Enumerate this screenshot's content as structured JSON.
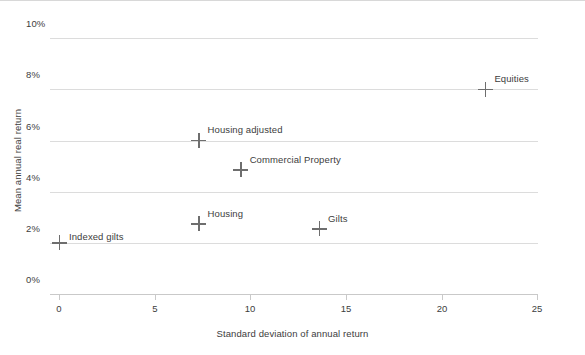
{
  "chart_data": {
    "type": "scatter",
    "title": "",
    "xlabel": "Standard deviation of annual return",
    "ylabel": "Mean annual real return",
    "xlim": [
      0,
      25
    ],
    "ylim": [
      0,
      10
    ],
    "xticks": [
      "0",
      "5",
      "10",
      "15",
      "20",
      "25"
    ],
    "xtick_values": [
      0,
      5,
      10,
      15,
      20,
      25
    ],
    "yticks": [
      "0%",
      "2%",
      "4%",
      "6%",
      "8%",
      "10%"
    ],
    "ytick_values": [
      0,
      2,
      4,
      6,
      8,
      10
    ],
    "grid": "horizontal",
    "legend": "none",
    "marker_style": "plus",
    "marker_color": "#6e6e6e",
    "points": [
      {
        "label": "Indexed gilts",
        "x": 0.0,
        "y": 2.0,
        "label_pos": "right"
      },
      {
        "label": "Housing",
        "x": 7.3,
        "y": 2.75,
        "label_pos": "upper-right"
      },
      {
        "label": "Gilts",
        "x": 13.6,
        "y": 2.55,
        "label_pos": "upper-right"
      },
      {
        "label": "Commercial Property",
        "x": 9.5,
        "y": 4.85,
        "label_pos": "upper-right"
      },
      {
        "label": "Housing adjusted",
        "x": 7.3,
        "y": 6.0,
        "label_pos": "upper-right"
      },
      {
        "label": "Equities",
        "x": 22.3,
        "y": 8.0,
        "label_pos": "upper-right"
      }
    ]
  },
  "colors": {
    "background": "#ffffff",
    "gridline": "#dcdcdc",
    "axis": "#c9c9c9",
    "text": "#3d3d3d",
    "marker": "#6e6e6e"
  }
}
